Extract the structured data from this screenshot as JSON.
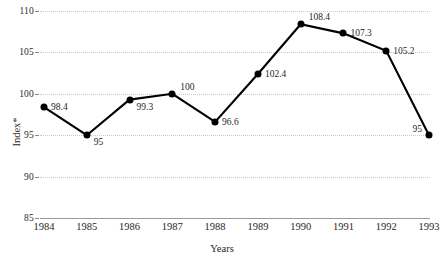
{
  "chart_data": {
    "type": "line",
    "title": "",
    "xlabel": "Years",
    "ylabel": "Index*",
    "categories": [
      "1984",
      "1985",
      "1986",
      "1987",
      "1988",
      "1989",
      "1990",
      "1991",
      "1992",
      "1993"
    ],
    "values": [
      98.4,
      95,
      99.3,
      100,
      96.6,
      102.4,
      108.4,
      107.3,
      105.2,
      95
    ],
    "point_labels": [
      "98.4",
      "95",
      "99.3",
      "100",
      "96.6",
      "102.4",
      "108.4",
      "107.3",
      "105.2",
      "95"
    ],
    "label_placement": [
      "right",
      "below-right",
      "below-right",
      "above-right",
      "right",
      "right",
      "above-right",
      "right",
      "right",
      "left"
    ],
    "ylim": [
      85,
      110
    ],
    "yticks": [
      85,
      90,
      95,
      100,
      105,
      110
    ],
    "ytick_labels": [
      "85",
      "90",
      "95",
      "100",
      "105",
      "110"
    ],
    "grid": true,
    "grid_style": "dotted",
    "legend": "none",
    "series": [
      {
        "name": "Index*",
        "values": [
          98.4,
          95,
          99.3,
          100,
          96.6,
          102.4,
          108.4,
          107.3,
          105.2,
          95
        ]
      }
    ],
    "colors": {
      "line": "#000000",
      "marker": "#000000",
      "grid": "#c9c9c9",
      "axis": "#9a9a9a",
      "text": "#1f1f1f"
    }
  }
}
